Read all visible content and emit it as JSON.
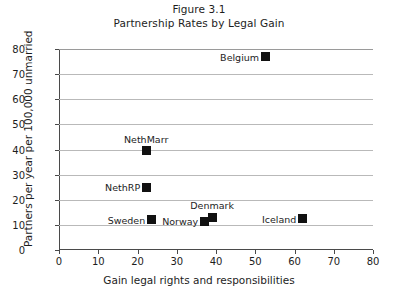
{
  "chart_data": {
    "type": "scatter",
    "title": "Figure 3.1",
    "subtitle": "Partnership Rates by Legal Gain",
    "xlabel": "Gain legal rights and responsibilities",
    "ylabel": "Partners per year per 100,000 unmarried",
    "xlim": [
      0,
      80
    ],
    "ylim": [
      0,
      80
    ],
    "xticks": [
      0,
      10,
      20,
      30,
      40,
      50,
      60,
      70,
      80
    ],
    "yticks": [
      0,
      10,
      20,
      30,
      40,
      50,
      60,
      70,
      80
    ],
    "grid": "horizontal",
    "legend": "none",
    "marker_color": "#111111",
    "grid_color": "#b9b9b9",
    "axis_color": "#4a4a4a",
    "points": [
      {
        "label": "Belgium",
        "x": 52.5,
        "y": 77.0,
        "label_pos": "left"
      },
      {
        "label": "NethMarr",
        "x": 22.2,
        "y": 39.5,
        "label_pos": "above"
      },
      {
        "label": "NethRP",
        "x": 22.2,
        "y": 25.0,
        "label_pos": "left"
      },
      {
        "label": "Sweden",
        "x": 23.5,
        "y": 12.0,
        "label_pos": "left"
      },
      {
        "label": "Norway",
        "x": 37.0,
        "y": 11.5,
        "label_pos": "left"
      },
      {
        "label": "Denmark",
        "x": 39.0,
        "y": 13.0,
        "label_pos": "above"
      },
      {
        "label": "Iceland",
        "x": 62.0,
        "y": 12.5,
        "label_pos": "left"
      }
    ]
  }
}
